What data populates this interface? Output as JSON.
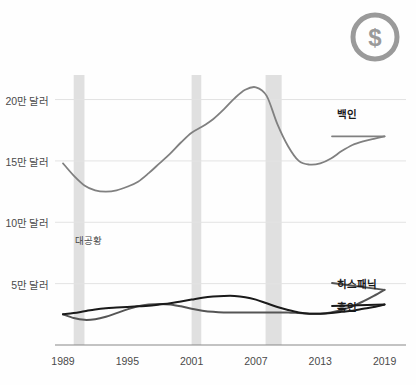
{
  "logo": {
    "icon": "dollar-circle-icon",
    "symbol": "$",
    "color": "#9a9a9a"
  },
  "chart_data": {
    "type": "line",
    "title": "",
    "xlabel": "",
    "ylabel": "",
    "xlim": [
      1989,
      2021
    ],
    "ylim": [
      0,
      220000
    ],
    "grid": true,
    "legend_position": "right-inline",
    "y_ticks": [
      50000,
      100000,
      150000,
      200000
    ],
    "y_tick_labels": [
      "5만 달러",
      "10만 달러",
      "15만 달러",
      "20만 달러"
    ],
    "x_ticks": [
      1989,
      1995,
      2001,
      2007,
      2013,
      2019
    ],
    "x_tick_labels": [
      "1989",
      "1995",
      "2001",
      "2007",
      "2013",
      "2019"
    ],
    "annotations": [
      {
        "text": "대공황",
        "x": 1990,
        "y": 72000,
        "name": "recession-annotation"
      }
    ],
    "shaded_bands": [
      {
        "name": "recession-band-1990",
        "x0": 1990.0,
        "x1": 1991.0,
        "color": "#e0e0e0"
      },
      {
        "name": "recession-band-2001",
        "x0": 2001.0,
        "x1": 2001.9,
        "color": "#e0e0e0"
      },
      {
        "name": "recession-band-2008",
        "x0": 2007.9,
        "x1": 2009.4,
        "color": "#e0e0e0"
      }
    ],
    "series": [
      {
        "name": "백인",
        "label": "백인",
        "color": "#808080",
        "x": [
          1989,
          1990,
          1991,
          1992,
          1993,
          1994,
          1995,
          1996,
          1997,
          1998,
          1999,
          2000,
          2001,
          2002,
          2003,
          2004,
          2005,
          2006,
          2007,
          2008,
          2009,
          2010,
          2011,
          2012,
          2013,
          2014,
          2015,
          2016,
          2017,
          2018,
          2019
        ],
        "values": [
          148000,
          138000,
          130000,
          126000,
          125000,
          126000,
          129000,
          133000,
          140000,
          148000,
          156000,
          165000,
          173000,
          178000,
          184000,
          192000,
          201000,
          208000,
          210000,
          203000,
          180000,
          162000,
          150000,
          147000,
          148000,
          152000,
          158000,
          163000,
          166000,
          168000,
          170000
        ]
      },
      {
        "name": "히스패닉",
        "label": "히스패닉",
        "color": "#555555",
        "x": [
          1989,
          1990,
          1991,
          1992,
          1993,
          1994,
          1995,
          1996,
          1997,
          1998,
          1999,
          2000,
          2001,
          2002,
          2003,
          2004,
          2005,
          2006,
          2007,
          2008,
          2009,
          2010,
          2011,
          2012,
          2013,
          2014,
          2015,
          2016,
          2017,
          2018,
          2019
        ],
        "values": [
          25000,
          22000,
          20500,
          21000,
          23000,
          26000,
          29000,
          31500,
          33000,
          33500,
          33000,
          31500,
          29500,
          28000,
          27000,
          26500,
          26500,
          26500,
          26500,
          26500,
          26500,
          26500,
          26000,
          25500,
          25500,
          26500,
          28500,
          31500,
          35500,
          40000,
          45000
        ]
      },
      {
        "name": "흑인",
        "label": "흑인",
        "color": "#1a1a1a",
        "x": [
          1989,
          1990,
          1991,
          1992,
          1993,
          1994,
          1995,
          1996,
          1997,
          1998,
          1999,
          2000,
          2001,
          2002,
          2003,
          2004,
          2005,
          2006,
          2007,
          2008,
          2009,
          2010,
          2011,
          2012,
          2013,
          2014,
          2015,
          2016,
          2017,
          2018,
          2019
        ],
        "values": [
          25000,
          26000,
          27500,
          29000,
          30000,
          30500,
          31000,
          31500,
          32000,
          33000,
          34000,
          35500,
          37000,
          38500,
          39500,
          40000,
          40000,
          39000,
          37000,
          34000,
          31000,
          28500,
          26500,
          25500,
          25500,
          26000,
          27000,
          28000,
          29500,
          31000,
          33000
        ]
      }
    ]
  },
  "axis": {
    "y_labels": [
      "20만 달러",
      "15만 달러",
      "10만 달러",
      "5만 달러"
    ],
    "x_labels": [
      "1989",
      "1995",
      "2001",
      "2007",
      "2013",
      "2019"
    ]
  },
  "series_labels": {
    "white": "백인",
    "hispanic": "히스패닉",
    "black": "흑인"
  },
  "annotation": {
    "recession": "대공황"
  }
}
